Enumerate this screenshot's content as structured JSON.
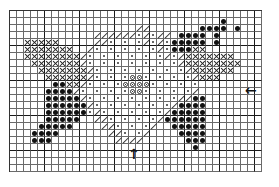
{
  "chart_data": {
    "type": "cross-stitch-pattern",
    "columns": 36,
    "rows": 23,
    "cell_px": 7,
    "heavy_line_every": 5,
    "legend": {
      ".": "empty",
      "x": "cross stitch",
      "/": "half stitch (backslash diagonal)",
      "o": "small dot",
      "*": "large filled dot",
      "c": "circled dot"
    },
    "grid": [
      "....................................",
      "..............................*.....",
      "..................//.......****.*...",
      "............//////o/o//.****.*......",
      "..xxxxx.....//o.o.o/o/o*****.*......",
      "..xxxxxxx../o.o.o.o.o/o***xx........",
      "..xxxxxxxx/o.o.o.o.o.o/o/xxxxxxx....",
      "...xxxxxxx/o.o.o.o.o.o.o/xxxxxxxx...",
      "....xxxxxxx/o.o.o.o.o.o.o/xxxxxx....",
      ".....xxxxxx/o.o.occo.o.o.o/xxx......",
      "......**xx/o.o.occcco.o.o.o.........",
      ".....****/o.o.o.occo.o.o.o/.........",
      ".....*****/o.o.o.o.o.o.o//**........",
      ".....******/o.o.o.o.o.o/****........",
      ".....******o/o.o.o.o.o/*****........",
      ".....*****..//o.o.o.o/******........",
      "....*****....//o.o.o/..*****........",
      "...****.......//o.o/....****........",
      "...***.........////......***........",
      "..........................*.........",
      "....................................",
      "....................................",
      "...................................."
    ],
    "annotations": [
      {
        "symbol": "left-arrow",
        "glyph": "←",
        "position": "right edge, center row"
      },
      {
        "symbol": "up-arrow",
        "glyph": "↑",
        "position": "bottom edge, center column"
      }
    ]
  },
  "arrows": {
    "left": "←",
    "up": "↑"
  }
}
